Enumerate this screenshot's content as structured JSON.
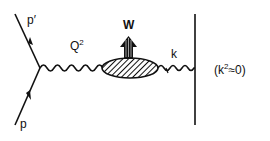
{
  "diagram": {
    "type": "feynman",
    "labels": {
      "incoming": "p",
      "outgoing": "p′",
      "virtual_photon": "Q",
      "virtual_photon_sup": "2",
      "hadronic_system": "W",
      "real_photon": "k",
      "condition_open": "(k",
      "condition_sup": "2",
      "condition_close": "≈0)"
    },
    "colors": {
      "ink": "#111111",
      "background": "#ffffff"
    }
  }
}
